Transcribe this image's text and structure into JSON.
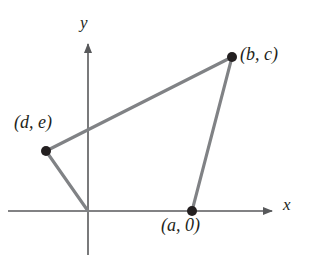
{
  "figure": {
    "kind": "coordinate-plane-quadrilateral",
    "background_color": "#ffffff",
    "axis_color": "#58595b",
    "polygon_color": "#808285",
    "vertex_color": "#231f20",
    "text_color": "#231f20",
    "axes": {
      "x_label": "x",
      "y_label": "y",
      "origin_px": [
        88,
        211
      ],
      "x_axis_px": {
        "x1": 8,
        "y1": 211,
        "x2": 278,
        "y2": 211
      },
      "y_axis_px": {
        "x1": 88,
        "y1": 38,
        "x2": 88,
        "y2": 255
      },
      "x_arrow_at_px": [
        278,
        211
      ],
      "y_arrow_at_px": [
        88,
        38
      ]
    },
    "vertices": [
      {
        "id": "origin",
        "label": "",
        "px": [
          88,
          211
        ],
        "marker": false
      },
      {
        "id": "a0",
        "label": "(a, 0)",
        "label_italic_parts": [
          "a"
        ],
        "px": [
          192,
          211
        ],
        "marker": true,
        "label_position": "below"
      },
      {
        "id": "bc",
        "label": "(b, c)",
        "label_italic_parts": [
          "b",
          "c"
        ],
        "px": [
          232,
          57
        ],
        "marker": true,
        "label_position": "right"
      },
      {
        "id": "de",
        "label": "(d, e)",
        "label_italic_parts": [
          "d",
          "e"
        ],
        "px": [
          46,
          151
        ],
        "marker": true,
        "label_position": "above-left"
      }
    ],
    "edges": [
      {
        "from": "origin",
        "to": "a0",
        "drawn": false
      },
      {
        "from": "a0",
        "to": "bc",
        "drawn": true
      },
      {
        "from": "bc",
        "to": "de",
        "drawn": true
      },
      {
        "from": "de",
        "to": "origin",
        "drawn": true
      }
    ]
  }
}
